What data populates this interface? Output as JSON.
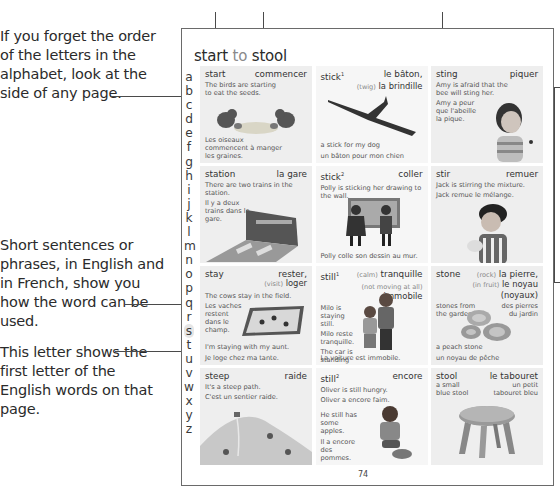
{
  "annotations": {
    "alphabet_note": "If you forget the order of the letters in the alphabet, look at the side of any page.",
    "sentences_note": "Short sentences or phrases, in English and in French, show you how the word can be used.",
    "letter_note": "This letter shows the first letter of the English words on that page."
  },
  "page": {
    "title_first": "start",
    "title_to": "to",
    "title_last": "stool",
    "number": "74",
    "alphabet": [
      "a",
      "b",
      "c",
      "d",
      "e",
      "f",
      "g",
      "h",
      "i",
      "j",
      "k",
      "l",
      "m",
      "n",
      "o",
      "p",
      "q",
      "r",
      "s",
      "t",
      "u",
      "v",
      "w",
      "x",
      "y",
      "z"
    ],
    "highlighted_letter": "s"
  },
  "entries": [
    {
      "word": "start",
      "french": "commencer",
      "example_en": "The birds are starting to eat the seeds.",
      "example_fr": "Les oiseaux commencent à manger les graines."
    },
    {
      "word": "stick",
      "sup": "1",
      "french": "le bâton,",
      "alt_gloss": "(twig)",
      "alt_french": "la brindille",
      "example_en": "a stick for my dog",
      "example_fr": "un bâton pour mon chien"
    },
    {
      "word": "sting",
      "french": "piquer",
      "example_en": "Amy is afraid that the bee will sting her.",
      "example_fr": "Amy a peur que l'abeille la pique."
    },
    {
      "word": "station",
      "french": "la gare",
      "example_en": "There are two trains in the station.",
      "example_fr": "Il y a deux trains dans la gare."
    },
    {
      "word": "stick",
      "sup": "2",
      "french": "coller",
      "example_en": "Polly is sticking her drawing to the wall.",
      "example_fr": "Polly colle son dessin au mur."
    },
    {
      "word": "stir",
      "french": "remuer",
      "example_en": "Jack is stirring the mixture.",
      "example_fr": "Jack remue le mélange."
    },
    {
      "word": "stay",
      "french": "rester,",
      "alt_gloss": "(visit)",
      "alt_french": "loger",
      "example_en": "The cows stay in the field.",
      "example_fr": "Les vaches restent dans le champ.",
      "example2_en": "I'm staying with my aunt.",
      "example2_fr": "Je loge chez ma tante."
    },
    {
      "word": "still",
      "sup": "1",
      "french_gloss": "(calm)",
      "french": "tranquille",
      "alt_gloss": "(not moving at all)",
      "alt_french": "immobile",
      "example_en": "Milo is staying still.",
      "example_fr": "Milo reste tranquille.",
      "example2_en": "The car is standing still.",
      "example2_fr": "La voiture est immobile."
    },
    {
      "word": "stone",
      "french_gloss": "(rock)",
      "french": "la pierre,",
      "alt_gloss": "(in fruit)",
      "alt_french": "le noyau (noyaux)",
      "example_en": "stones from the garden",
      "example_fr": "des pierres du jardin",
      "example2_en": "a peach stone",
      "example2_fr": "un noyau de pêche"
    },
    {
      "word": "steep",
      "french": "raide",
      "example_en": "It's a steep path.",
      "example_fr": "C'est un sentier raide."
    },
    {
      "word": "still",
      "sup": "2",
      "french": "encore",
      "example_en": "Oliver is still hungry.",
      "example_fr": "Oliver a encore faim.",
      "example2_en": "He still has some apples.",
      "example2_fr": "Il a encore des pommes."
    },
    {
      "word": "stool",
      "french": "le tabouret",
      "example_en": "a small blue stool",
      "example_fr": "un petit tabouret bleu"
    }
  ]
}
